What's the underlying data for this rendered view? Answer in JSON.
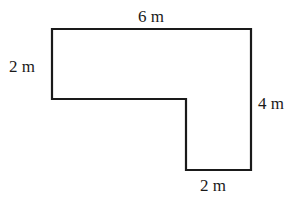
{
  "diagram": {
    "type": "L-shaped polygon with dimension labels",
    "stroke_color": "#1a1a1a",
    "vertices": [
      [
        52,
        29
      ],
      [
        251,
        29
      ],
      [
        251,
        170
      ],
      [
        186,
        170
      ],
      [
        186,
        99
      ],
      [
        52,
        99
      ]
    ],
    "labels": {
      "top": "6 m",
      "left": "2 m",
      "right": "4 m",
      "bottom": "2 m"
    }
  }
}
